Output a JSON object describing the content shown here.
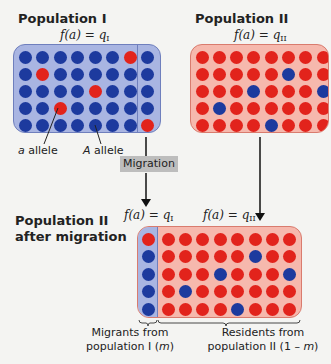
{
  "populations": {
    "pop1": {
      "title": "Population I",
      "formula_lhs": "f(a) = q",
      "formula_sub": "I",
      "grid": [
        [
          "A",
          "A",
          "A",
          "A",
          "A",
          "A",
          "a",
          "A"
        ],
        [
          "A",
          "a",
          "A",
          "A",
          "A",
          "A",
          "A",
          "A"
        ],
        [
          "A",
          "A",
          "A",
          "A",
          "a",
          "A",
          "A",
          "A"
        ],
        [
          "A",
          "A",
          "a",
          "A",
          "A",
          "A",
          "A",
          "A"
        ],
        [
          "A",
          "A",
          "A",
          "A",
          "A",
          "A",
          "A",
          "a"
        ]
      ],
      "migrant_column_index": 7
    },
    "pop2": {
      "title": "Population II",
      "formula_lhs": "f(a) = q",
      "formula_sub": "II",
      "grid": [
        [
          "a",
          "a",
          "a",
          "a",
          "a",
          "a",
          "a",
          "a"
        ],
        [
          "a",
          "a",
          "a",
          "a",
          "a",
          "A",
          "a",
          "a"
        ],
        [
          "a",
          "a",
          "a",
          "A",
          "a",
          "a",
          "a",
          "A"
        ],
        [
          "a",
          "A",
          "a",
          "a",
          "a",
          "a",
          "a",
          "a"
        ],
        [
          "a",
          "a",
          "a",
          "a",
          "A",
          "a",
          "a",
          "a"
        ]
      ]
    },
    "pop2_after": {
      "title_line1": "Population II",
      "title_line2": "after migration",
      "migrant_formula_lhs": "f(a) = q",
      "migrant_formula_sub": "I",
      "resident_formula_lhs": "f(a) = q",
      "resident_formula_sub": "II",
      "migrant_column": [
        "a",
        "A",
        "A",
        "A",
        "A"
      ],
      "resident_grid": [
        [
          "a",
          "a",
          "a",
          "a",
          "a",
          "a",
          "a",
          "a"
        ],
        [
          "a",
          "a",
          "a",
          "a",
          "a",
          "A",
          "a",
          "a"
        ],
        [
          "a",
          "a",
          "a",
          "A",
          "a",
          "a",
          "a",
          "A"
        ],
        [
          "a",
          "A",
          "a",
          "a",
          "a",
          "a",
          "a",
          "a"
        ],
        [
          "a",
          "a",
          "a",
          "a",
          "A",
          "a",
          "a",
          "a"
        ]
      ]
    }
  },
  "labels": {
    "a_allele_italic": "a",
    "a_allele_text": " allele",
    "A_allele_italic": "A",
    "A_allele_text": " allele",
    "migration": "Migration",
    "migrants_line1": "Migrants from",
    "migrants_line2_pre": "population I (",
    "migrants_line2_m": "m",
    "migrants_line2_post": ")",
    "residents_line1": "Residents from",
    "residents_line2_pre": "population II (1 –  ",
    "residents_line2_m": "m",
    "residents_line2_post": ")"
  },
  "colors": {
    "A_allele_dot": "#1d3a9e",
    "a_allele_dot": "#e2231c",
    "pop1_fill": "#a9b5e2",
    "pop2_fill": "#f6b8ad"
  }
}
